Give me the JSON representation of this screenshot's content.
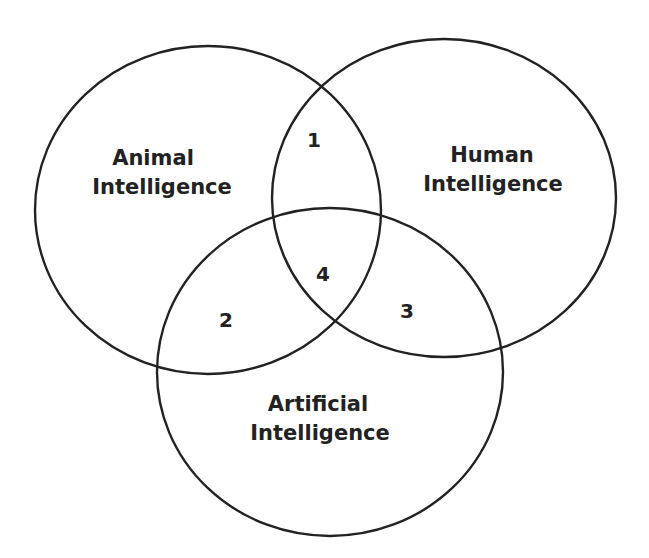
{
  "diagram": {
    "type": "venn",
    "sets": [
      {
        "id": "animal",
        "line1": "Animal",
        "line2": "Intelligence"
      },
      {
        "id": "human",
        "line1": "Human",
        "line2": "Intelligence"
      },
      {
        "id": "artificial",
        "line1": "Artificial",
        "line2": "Intelligence"
      }
    ],
    "regions": [
      {
        "label": "1",
        "sets": [
          "animal",
          "human"
        ]
      },
      {
        "label": "2",
        "sets": [
          "animal",
          "artificial"
        ]
      },
      {
        "label": "3",
        "sets": [
          "human",
          "artificial"
        ]
      },
      {
        "label": "4",
        "sets": [
          "animal",
          "human",
          "artificial"
        ]
      }
    ],
    "colors": {
      "stroke": "#222222",
      "background": "#ffffff"
    }
  }
}
